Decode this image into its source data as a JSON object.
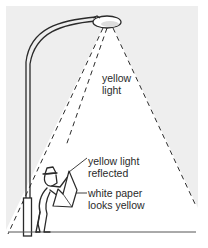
{
  "diagram": {
    "labels": {
      "light_line1": "yellow",
      "light_line2": "light",
      "reflected_line1": "yellow light",
      "reflected_line2": "reflected",
      "paper_line1": "white paper",
      "paper_line2": "looks yellow"
    },
    "colors": {
      "background": "#eeeeee",
      "cone": "#ffffff",
      "ink": "#2a2a2a"
    }
  }
}
